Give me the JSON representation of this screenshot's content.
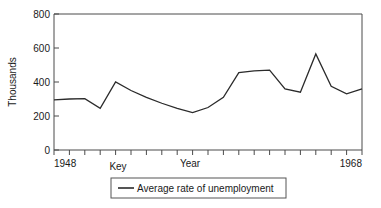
{
  "chart_data": {
    "type": "line",
    "title": "",
    "xlabel": "Year",
    "ylabel": "Thousands",
    "xlim": [
      1948,
      1968
    ],
    "ylim": [
      0,
      800
    ],
    "grid": false,
    "legend_position": "below-axis",
    "x_tick_labels": [
      "1948",
      "1968"
    ],
    "y_tick_labels": [
      "0",
      "200",
      "400",
      "600",
      "800"
    ],
    "y_ticks": [
      0,
      200,
      400,
      600,
      800
    ],
    "key_label": "Key",
    "series": [
      {
        "name": "Average rate of unemployment",
        "x": [
          1948,
          1949,
          1950,
          1951,
          1952,
          1953,
          1954,
          1955,
          1956,
          1957,
          1958,
          1959,
          1960,
          1961,
          1962,
          1963,
          1964,
          1965,
          1966,
          1967,
          1968
        ],
        "values": [
          295,
          300,
          302,
          245,
          400,
          350,
          310,
          275,
          245,
          220,
          250,
          310,
          455,
          465,
          470,
          360,
          340,
          565,
          375,
          330,
          360
        ]
      }
    ],
    "legend": [
      {
        "label": "Average rate of unemployment",
        "color": "#2b2b2b",
        "marker": "line"
      }
    ],
    "colors": {
      "line": "#2b2b2b",
      "axis": "#4a4a4a",
      "text": "#1a1a1a",
      "background": "#ffffff"
    }
  },
  "plot_geometry": {
    "left": 54,
    "right": 362,
    "top": 14,
    "bottom": 150
  },
  "polyline_points": "54,101 85,100 93,108 118,82 132,89 148,99 158,106 165,113 176,108 188,98 196,95 204,76 212,73 220,72 228,79 238,92 248,93 258,83 268,66 277,53 288,72 298,88 306,97 318,96 330,93 345,55 362,56"
}
